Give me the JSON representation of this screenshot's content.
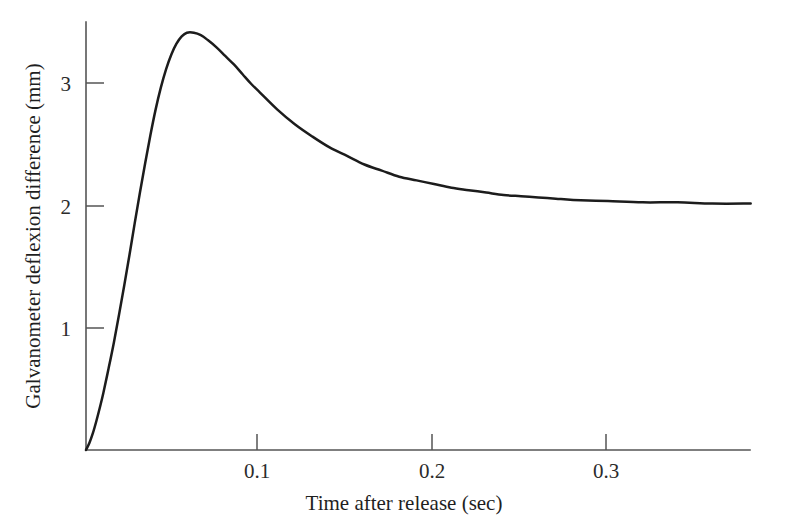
{
  "chart_data": {
    "type": "line",
    "title": "",
    "xlabel": "Time after release (sec)",
    "ylabel": "Galvanometer deflexion difference (mm)",
    "xlim": [
      0,
      0.382
    ],
    "ylim": [
      0,
      3.68
    ],
    "grid": false,
    "legend": null,
    "xticks": [
      0.1,
      0.2,
      0.3
    ],
    "xtick_labels": [
      "0.1",
      "0.2",
      "0.3"
    ],
    "yticks": [
      1,
      2,
      3
    ],
    "ytick_labels": [
      "1",
      "2",
      "3"
    ],
    "line_color": "#1c1c1c",
    "axis_color": "#555555",
    "background": "#ffffff",
    "annotations": {
      "peak_time_sec": 0.058,
      "peak_value_mm": 3.42,
      "asymptote_value_mm": 2.02
    },
    "series": [
      {
        "name": "Galvanometer deflexion difference",
        "x": [
          0.0,
          0.002,
          0.004,
          0.006,
          0.008,
          0.01,
          0.013,
          0.016,
          0.019,
          0.022,
          0.025,
          0.028,
          0.031,
          0.034,
          0.037,
          0.04,
          0.043,
          0.046,
          0.049,
          0.052,
          0.055,
          0.058,
          0.062,
          0.066,
          0.07,
          0.075,
          0.08,
          0.085,
          0.09,
          0.095,
          0.1,
          0.11,
          0.12,
          0.13,
          0.14,
          0.15,
          0.16,
          0.17,
          0.18,
          0.19,
          0.2,
          0.21,
          0.22,
          0.23,
          0.24,
          0.25,
          0.26,
          0.27,
          0.28,
          0.3,
          0.32,
          0.34,
          0.36,
          0.382
        ],
        "y": [
          0.0,
          0.06,
          0.14,
          0.24,
          0.35,
          0.47,
          0.67,
          0.88,
          1.11,
          1.35,
          1.6,
          1.86,
          2.11,
          2.35,
          2.58,
          2.79,
          2.97,
          3.12,
          3.24,
          3.33,
          3.39,
          3.42,
          3.42,
          3.4,
          3.36,
          3.3,
          3.23,
          3.16,
          3.08,
          3.0,
          2.93,
          2.79,
          2.67,
          2.57,
          2.48,
          2.41,
          2.34,
          2.29,
          2.24,
          2.21,
          2.18,
          2.15,
          2.13,
          2.11,
          2.09,
          2.08,
          2.07,
          2.06,
          2.05,
          2.04,
          2.03,
          2.03,
          2.02,
          2.02
        ]
      }
    ]
  },
  "axes": {
    "y_axis_label": "Galvanometer deflexion difference (mm)",
    "x_axis_label": "Time after release (sec)"
  }
}
